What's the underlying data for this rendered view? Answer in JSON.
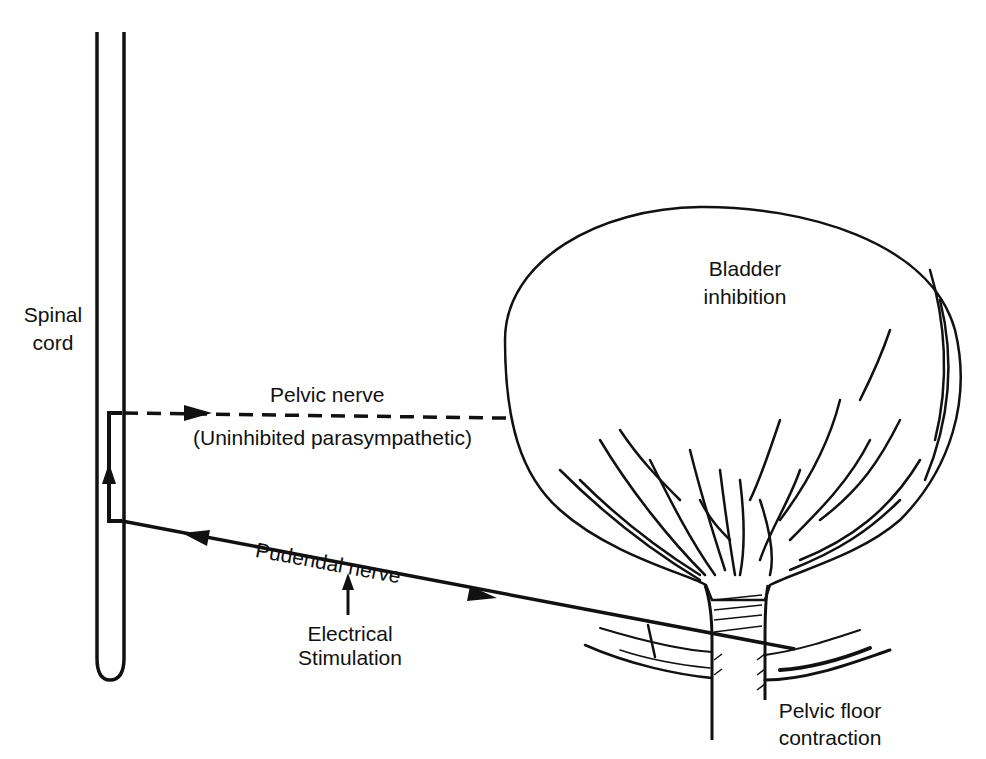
{
  "figure": {
    "background": "#ffffff",
    "ink_color": "#111111"
  },
  "labels": {
    "spinal_cord": [
      "Spinal",
      "cord"
    ],
    "pelvic_nerve": "Pelvic nerve",
    "pelvic_nerve_note": "(Uninhibited parasympathetic)",
    "pudendal_nerve": "Pudendal nerve",
    "electrical_stimulation": [
      "Electrical",
      "Stimulation"
    ],
    "bladder_inhibition": [
      "Bladder",
      "inhibition"
    ],
    "pelvic_floor_contraction": [
      "Pelvic floor",
      "contraction"
    ]
  },
  "icons": {
    "pelvic_nerve_arrow": "arrow-right-icon",
    "spinal_ascending_arrow": "arrow-up-icon",
    "pudendal_afferent_arrow": "arrow-left-icon",
    "pudendal_efferent_arrow": "arrow-right-icon",
    "stimulation_arrow": "arrow-up-icon"
  }
}
